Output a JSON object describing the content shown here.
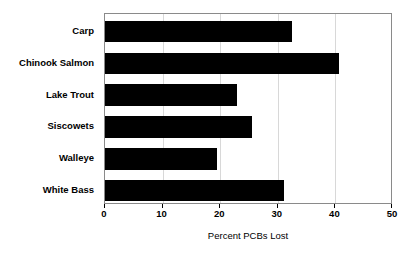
{
  "chart_data": {
    "type": "bar",
    "orientation": "horizontal",
    "title": "",
    "xlabel": "Percent PCBs Lost",
    "ylabel": "",
    "categories": [
      "Carp",
      "Chinook Salmon",
      "Lake Trout",
      "Siscowets",
      "Walleye",
      "White Bass"
    ],
    "values": [
      32.5,
      40.6,
      22.9,
      25.5,
      19.4,
      31.1
    ],
    "xlim": [
      0,
      50
    ],
    "xticks": [
      0,
      10,
      20,
      30,
      40,
      50
    ],
    "xtick_labels": [
      "0",
      "10",
      "20",
      "30",
      "40",
      "50"
    ],
    "grid": {
      "vertical": true,
      "horizontal": false
    },
    "legend": null,
    "bar_color": "#000000",
    "frame_color": "#8a8a8a",
    "gridline_color": "#d8d8d8",
    "background_color": "#ffffff"
  }
}
